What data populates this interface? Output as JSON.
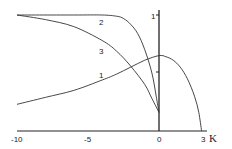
{
  "chart_data": {
    "type": "line",
    "title": "",
    "xlabel": "K",
    "ylabel": "",
    "xlim": [
      -10,
      3
    ],
    "ylim": [
      0,
      1
    ],
    "grid": false,
    "legend": "inline curve labels",
    "x_ticks": [
      -10,
      -5,
      0,
      3
    ],
    "x_tick_labels": [
      "-10",
      "-5",
      "0",
      "3"
    ],
    "y_ticks": [
      0.5,
      1
    ],
    "y_tick_labels": [
      "",
      "1"
    ],
    "series": [
      {
        "name": "1",
        "x": [
          -10,
          -8,
          -6,
          -4,
          -3,
          -2,
          -1,
          0,
          0.5,
          1,
          1.5,
          2,
          2.5,
          2.8,
          3
        ],
        "y": [
          0.23,
          0.29,
          0.35,
          0.44,
          0.49,
          0.55,
          0.61,
          0.65,
          0.64,
          0.61,
          0.55,
          0.45,
          0.3,
          0.16,
          0
        ]
      },
      {
        "name": "2",
        "x": [
          -10,
          -6,
          -4,
          -3,
          -2.5,
          -2,
          -1.5,
          -1,
          -0.5,
          -0.2,
          0
        ],
        "y": [
          1,
          1,
          1,
          0.99,
          0.97,
          0.92,
          0.84,
          0.7,
          0.5,
          0.3,
          0.16
        ]
      },
      {
        "name": "3",
        "x": [
          -10,
          -8,
          -6,
          -4,
          -3,
          -2,
          -1,
          -0.5,
          0
        ],
        "y": [
          1,
          0.96,
          0.9,
          0.78,
          0.69,
          0.56,
          0.4,
          0.28,
          0.16
        ]
      }
    ],
    "annotations": [
      {
        "text": "1",
        "x": -4.1,
        "y": 0.55
      },
      {
        "text": "2",
        "x": -4.0,
        "y": 0.96
      },
      {
        "text": "3",
        "x": -4.0,
        "y": 0.77
      }
    ]
  },
  "axis": {
    "x_label": "K",
    "x_ticks": [
      "-10",
      "-5",
      "0",
      "3"
    ],
    "y_tick_top": "1"
  },
  "curve_labels": [
    "1",
    "2",
    "3"
  ]
}
